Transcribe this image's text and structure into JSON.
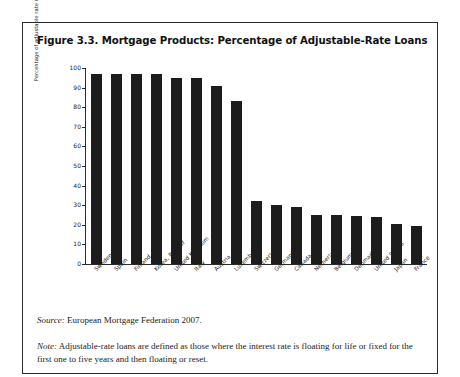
{
  "figure": {
    "title": "Figure 3.3. Mortgage Products: Percentage of Adjustable-Rate Loans",
    "source_label": "Source:",
    "source_text": " European Mortgage Federation 2007.",
    "note_label": "Note:",
    "note_text": " Adjustable-rate loans are defined as those where the interest rate is floating for life or fixed for the first one to five years and then floating or reset."
  },
  "chart_data": {
    "type": "bar",
    "title": "Figure 3.3. Mortgage Products: Percentage of Adjustable-Rate Loans",
    "xlabel": "",
    "ylabel": "Percentage of adjustable rate mortgages",
    "ylim": [
      0,
      100
    ],
    "yticks": [
      0,
      10,
      20,
      30,
      40,
      50,
      60,
      70,
      80,
      90,
      100
    ],
    "grid": false,
    "legend": "none",
    "bar_color": "#1c1c1c",
    "categories": [
      "Sweden",
      "Spain",
      "Finland",
      "Korea, Rep. of",
      "United Kingdom",
      "Italy",
      "Austria",
      "Luxembourg",
      "Switzerland",
      "Germany",
      "Canada",
      "Netherlands",
      "Belgium",
      "Denmark",
      "United States",
      "Japan",
      "France"
    ],
    "values": [
      97,
      97,
      97,
      97,
      95,
      95,
      91,
      83,
      32,
      30,
      29,
      25,
      25,
      24.5,
      24,
      20.5,
      19.5
    ]
  }
}
